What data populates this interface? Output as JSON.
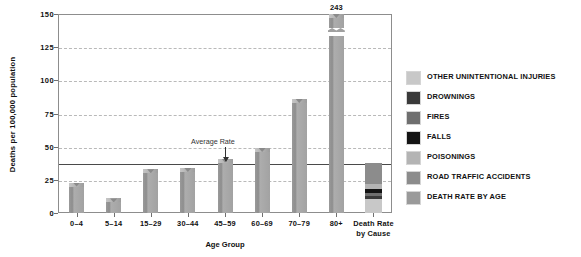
{
  "chart_data": {
    "type": "bar",
    "title": "",
    "xlabel": "Age Group",
    "ylabel": "Deaths per 100,000 population",
    "ylim": [
      0,
      150
    ],
    "yticks": [
      0,
      25,
      50,
      75,
      100,
      125,
      150
    ],
    "grid": true,
    "categories": [
      "0–4",
      "5–14",
      "15–29",
      "30–44",
      "45–59",
      "60–69",
      "70–79",
      "80+"
    ],
    "values": [
      23,
      11,
      33,
      34,
      41,
      49,
      86,
      243
    ],
    "value_labels": [
      "",
      "",
      "",
      "",
      "",
      "",
      "",
      "243"
    ],
    "broken_axis_bar": "80+",
    "annotations": [
      {
        "text": "Average Rate",
        "value": 38,
        "type": "reference-line-with-arrow"
      }
    ],
    "extra_category": {
      "label_line1": "Death Rate",
      "label_line2": "by Cause",
      "type": "stacked",
      "total": 38,
      "segments": [
        {
          "name": "OTHER UNINTENTIONAL INJURIES",
          "value": 10.4,
          "color": "#c8c8c8"
        },
        {
          "name": "DROWNINGS",
          "value": 2.6,
          "color": "#3a3a3a"
        },
        {
          "name": "FIRES",
          "value": 2.0,
          "color": "#6f6f6f"
        },
        {
          "name": "FALLS",
          "value": 3.4,
          "color": "#141414"
        },
        {
          "name": "POISONINGS",
          "value": 3.6,
          "color": "#b4b4b4"
        },
        {
          "name": "ROAD TRAFFIC ACCIDENTS",
          "value": 16.0,
          "color": "#8c8c8c"
        }
      ]
    },
    "legend_position": "right",
    "legend": [
      {
        "label": "OTHER UNINTENTIONAL INJURIES",
        "color": "#c8c8c8"
      },
      {
        "label": "DROWNINGS",
        "color": "#3a3a3a"
      },
      {
        "label": "FIRES",
        "color": "#6f6f6f"
      },
      {
        "label": "FALLS",
        "color": "#141414"
      },
      {
        "label": "POISONINGS",
        "color": "#b4b4b4"
      },
      {
        "label": "ROAD TRAFFIC ACCIDENTS",
        "color": "#8c8c8c"
      },
      {
        "label": "DEATH RATE BY AGE",
        "color": "#9a9a9a"
      }
    ]
  },
  "colors": {
    "bar": "#9a9a9a",
    "grid": "#b9b9b9",
    "axis": "#8d8d8d",
    "average_line": "#4a4a4a",
    "text": "#111111"
  }
}
